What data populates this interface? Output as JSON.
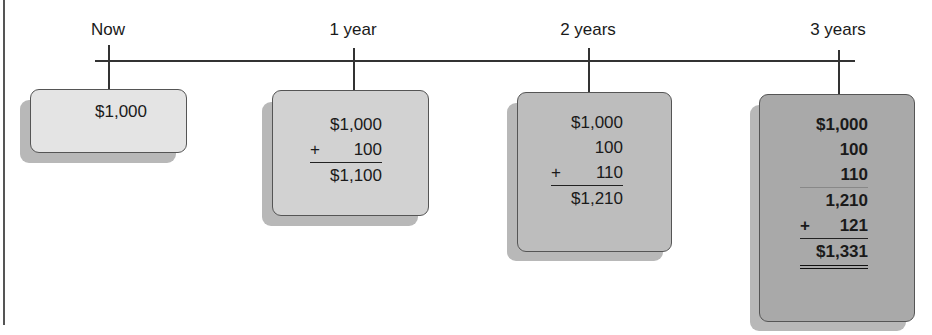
{
  "colors": {
    "box_now": "#e4e4e4",
    "box_year1": "#d2d2d2",
    "box_year2": "#bdbdbd",
    "box_year3": "#a9a9a9",
    "line": "#333333"
  },
  "periods": [
    {
      "label": "Now",
      "rows": [
        {
          "op": "",
          "value": "$1,000"
        }
      ],
      "total": null
    },
    {
      "label": "1 year",
      "rows": [
        {
          "op": "",
          "value": "$1,000"
        },
        {
          "op": "+",
          "value": "100"
        }
      ],
      "total": "$1,100"
    },
    {
      "label": "2 years",
      "rows": [
        {
          "op": "",
          "value": "$1,000"
        },
        {
          "op": "",
          "value": "100"
        },
        {
          "op": "+",
          "value": "110"
        }
      ],
      "total": "$1,210"
    },
    {
      "label": "3 years",
      "rows": [
        {
          "op": "",
          "value": "$1,000"
        },
        {
          "op": "",
          "value": "100"
        },
        {
          "op": "",
          "value": "110"
        },
        {
          "op": "",
          "value": "1,210"
        },
        {
          "op": "+",
          "value": "121"
        }
      ],
      "subtotal_after_row": 2,
      "total": "$1,331"
    }
  ]
}
